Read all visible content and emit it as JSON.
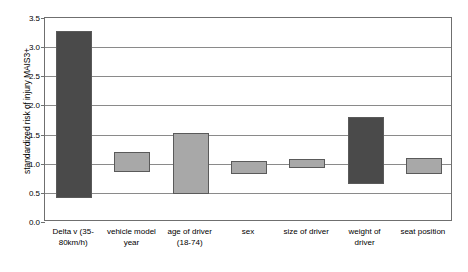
{
  "chart_data": {
    "type": "bar",
    "subtype": "floating-range-bar",
    "title": "",
    "xlabel": "",
    "ylabel": "standardized risk of injury MAIS3+",
    "ylim": [
      0.0,
      3.5
    ],
    "yticks": [
      "0.0",
      "0.5",
      "1.0",
      "1.5",
      "2.0",
      "2.5",
      "3.0",
      "3.5"
    ],
    "ytick_values": [
      0.0,
      0.5,
      1.0,
      1.5,
      2.0,
      2.5,
      3.0,
      3.5
    ],
    "grid": true,
    "legend": "none",
    "categories": [
      "Delta v (35-\n80km/h)",
      "vehicle model\nyear",
      "age of driver\n(18-74)",
      "sex",
      "size of driver",
      "weight of\ndriver",
      "seat position"
    ],
    "series": [
      {
        "name": "standardized risk range",
        "low": [
          0.42,
          0.85,
          0.48,
          0.82,
          0.92,
          0.65,
          0.83
        ],
        "high": [
          3.27,
          1.2,
          1.52,
          1.05,
          1.08,
          1.8,
          1.1
        ]
      }
    ],
    "bar_colors": [
      "#4a4a4a",
      "#a8a8a8",
      "#a8a8a8",
      "#a8a8a8",
      "#a8a8a8",
      "#4a4a4a",
      "#a8a8a8"
    ],
    "colors": {
      "dark_bar": "#4a4a4a",
      "light_bar": "#a8a8a8",
      "bar_edge": "#5a5a5a",
      "gridline": "#8a8a8a",
      "axis": "#6f6f6f",
      "background": "#ffffff",
      "text": "#000000"
    }
  }
}
